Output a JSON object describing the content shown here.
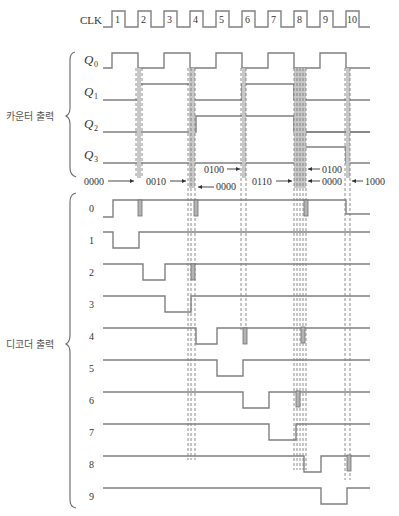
{
  "clock": {
    "label": "CLK",
    "pulses": [
      "1",
      "2",
      "3",
      "4",
      "5",
      "6",
      "7",
      "8",
      "9",
      "10"
    ]
  },
  "counter": {
    "group_label": "카운터 출력",
    "outputs": [
      {
        "name": "Q",
        "sub": "0"
      },
      {
        "name": "Q",
        "sub": "1"
      },
      {
        "name": "Q",
        "sub": "2"
      },
      {
        "name": "Q",
        "sub": "3"
      }
    ]
  },
  "state_annotations": {
    "s1": "0000",
    "s2": "0010",
    "s3": "0000",
    "s4": "0100",
    "s5": "0110",
    "s6": "0100",
    "s7": "0000",
    "s8": "1000"
  },
  "decoder": {
    "group_label": "디코더 출력",
    "outputs": [
      "0",
      "1",
      "2",
      "3",
      "4",
      "5",
      "6",
      "7",
      "8",
      "9"
    ]
  },
  "colors": {
    "waveform": "#808080",
    "glitch_bar": "#b4b4b4",
    "text": "#333333"
  }
}
